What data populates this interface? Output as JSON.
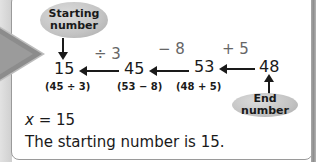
{
  "labels": {
    "start_bubble": "Starting number",
    "end_bubble": "End number"
  },
  "chain": {
    "numbers": [
      "15",
      "45",
      "53",
      "48"
    ],
    "operations": [
      "÷ 3",
      "− 8",
      "+ 5"
    ],
    "checks": [
      "(45 ÷ 3)",
      "(53 −  8)",
      "(48 + 5)"
    ]
  },
  "answer": {
    "variable": "x",
    "equation_rest": " = 15",
    "statement": "The starting number is 15."
  },
  "colors": {
    "bubble": "#c3c3c3",
    "operation_text": "#666666",
    "text": "#1a1a1a",
    "arrow_decoration": "#8c8c8c"
  }
}
